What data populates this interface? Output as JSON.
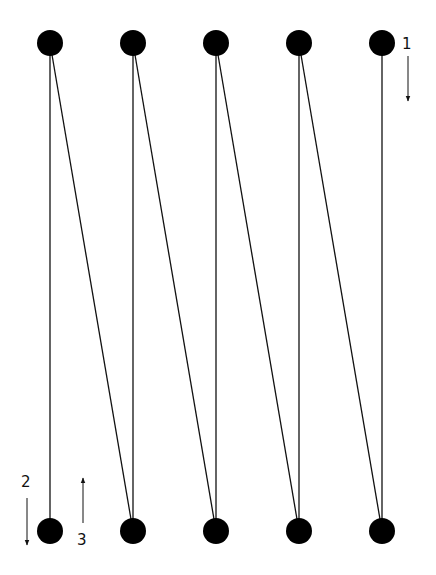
{
  "diagram": {
    "type": "zigzag-scan-path",
    "colors": {
      "node": "#000000",
      "line": "#111111",
      "background": "#ffffff"
    },
    "node_radius": 13,
    "top_row": [
      {
        "id": "t1",
        "x": 50,
        "y": 43
      },
      {
        "id": "t2",
        "x": 133,
        "y": 43
      },
      {
        "id": "t3",
        "x": 216,
        "y": 43
      },
      {
        "id": "t4",
        "x": 299,
        "y": 43
      },
      {
        "id": "t5",
        "x": 382,
        "y": 43
      }
    ],
    "bottom_row": [
      {
        "id": "b1",
        "x": 50,
        "y": 531
      },
      {
        "id": "b2",
        "x": 133,
        "y": 531
      },
      {
        "id": "b3",
        "x": 216,
        "y": 531
      },
      {
        "id": "b4",
        "x": 299,
        "y": 531
      },
      {
        "id": "b5",
        "x": 382,
        "y": 531
      }
    ],
    "edges": [
      [
        "t1",
        "b1"
      ],
      [
        "t2",
        "b2"
      ],
      [
        "t3",
        "b3"
      ],
      [
        "t4",
        "b4"
      ],
      [
        "t5",
        "b5"
      ],
      [
        "t1",
        "b2"
      ],
      [
        "t2",
        "b3"
      ],
      [
        "t3",
        "b4"
      ],
      [
        "t4",
        "b5"
      ]
    ],
    "annotations": [
      {
        "label": "1",
        "label_x": 402,
        "label_y": 37,
        "arrow": {
          "x": 408,
          "y1": 56,
          "y2": 101,
          "direction": "down"
        }
      },
      {
        "label": "2",
        "label_x": 21,
        "label_y": 475,
        "arrow": {
          "x": 27,
          "y1": 498,
          "y2": 545,
          "direction": "down"
        }
      },
      {
        "label": "3",
        "label_x": 77,
        "label_y": 533,
        "arrow": {
          "x": 83,
          "y1": 523,
          "y2": 478,
          "direction": "up"
        }
      }
    ]
  }
}
